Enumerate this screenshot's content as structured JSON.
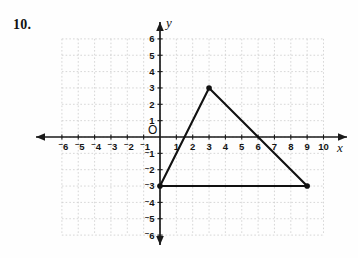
{
  "problem": {
    "number": "10."
  },
  "graph": {
    "axis_labels": {
      "x": "x",
      "y": "y",
      "origin": "O"
    },
    "x_ticks": [
      {
        "value": -6,
        "label": "6",
        "negative": true
      },
      {
        "value": -5,
        "label": "5",
        "negative": true
      },
      {
        "value": -4,
        "label": "4",
        "negative": true
      },
      {
        "value": -3,
        "label": "3",
        "negative": true
      },
      {
        "value": -2,
        "label": "2",
        "negative": true
      },
      {
        "value": -1,
        "label": "1",
        "negative": true
      },
      {
        "value": 1,
        "label": "1",
        "negative": false
      },
      {
        "value": 2,
        "label": "2",
        "negative": false
      },
      {
        "value": 3,
        "label": "3",
        "negative": false
      },
      {
        "value": 4,
        "label": "4",
        "negative": false
      },
      {
        "value": 5,
        "label": "5",
        "negative": false
      },
      {
        "value": 6,
        "label": "6",
        "negative": false
      },
      {
        "value": 7,
        "label": "7",
        "negative": false
      },
      {
        "value": 8,
        "label": "8",
        "negative": false
      },
      {
        "value": 9,
        "label": "9",
        "negative": false
      },
      {
        "value": 10,
        "label": "10",
        "negative": false
      }
    ],
    "y_ticks": [
      {
        "value": 6,
        "label": "6",
        "negative": false
      },
      {
        "value": 5,
        "label": "5",
        "negative": false
      },
      {
        "value": 4,
        "label": "4",
        "negative": false
      },
      {
        "value": 3,
        "label": "3",
        "negative": false
      },
      {
        "value": 2,
        "label": "2",
        "negative": false
      },
      {
        "value": 1,
        "label": "1",
        "negative": false
      },
      {
        "value": -1,
        "label": "1",
        "negative": true
      },
      {
        "value": -2,
        "label": "2",
        "negative": true
      },
      {
        "value": -3,
        "label": "3",
        "negative": true
      },
      {
        "value": -4,
        "label": "4",
        "negative": true
      },
      {
        "value": -5,
        "label": "5",
        "negative": true
      },
      {
        "value": -6,
        "label": "6",
        "negative": true
      }
    ],
    "colors": {
      "grid": "#cfcfcf",
      "axis": "#1a1a1a",
      "figure": "#111111",
      "background": "#fefefe"
    }
  },
  "chart_data": {
    "type": "scatter",
    "title": "",
    "xlabel": "x",
    "ylabel": "y",
    "xlim": [
      -6,
      10
    ],
    "ylim": [
      -6,
      6
    ],
    "grid": true,
    "legend": null,
    "series": [
      {
        "name": "triangle",
        "shape": "polygon",
        "closed": true,
        "marked_vertices": true,
        "points": [
          {
            "x": 0,
            "y": -3
          },
          {
            "x": 3,
            "y": 3
          },
          {
            "x": 9,
            "y": -3
          }
        ]
      }
    ],
    "annotations": [
      {
        "text": "10.",
        "role": "problem-number"
      }
    ]
  }
}
